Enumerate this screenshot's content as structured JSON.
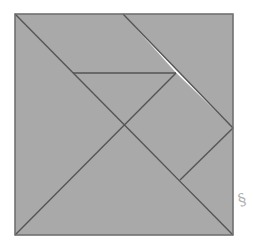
{
  "diagram": {
    "type": "tangram-square",
    "title": "",
    "colors": {
      "fill": "#a9a9a9",
      "stroke": "#555555",
      "border": "#6e6e6e",
      "background": "#ffffff",
      "mark": "#b0b0b0"
    },
    "square": {
      "x": 15,
      "y": 14,
      "width": 218,
      "height": 221
    },
    "pieces": [
      {
        "name": "large-triangle-left",
        "points": "15,14 124,125 15,235"
      },
      {
        "name": "large-triangle-bottom",
        "points": "15,235 124,125 233,235"
      },
      {
        "name": "parallelogram-top",
        "points": "15,14 123,14 176,73 73,73"
      },
      {
        "name": "medium-triangle-top-right",
        "points": "123,14 233,14 233,128"
      },
      {
        "name": "small-triangle-center",
        "points": "73,73 176,73 124,125"
      },
      {
        "name": "square-piece",
        "points": "176,73 233,128 180,180 124,125"
      },
      {
        "name": "small-triangle-right",
        "points": "233,128 233,235 180,180"
      }
    ],
    "lines": [
      {
        "name": "main-diagonal",
        "x1": 15,
        "y1": 14,
        "x2": 233,
        "y2": 235
      },
      {
        "name": "anti-diagonal-segment",
        "x1": 15,
        "y1": 235,
        "x2": 176,
        "y2": 73
      },
      {
        "name": "top-diagonal",
        "x1": 123,
        "y1": 14,
        "x2": 233,
        "y2": 128
      },
      {
        "name": "horizontal-segment",
        "x1": 73,
        "y1": 73,
        "x2": 176,
        "y2": 73
      },
      {
        "name": "lower-right-segment",
        "x1": 233,
        "y1": 128,
        "x2": 180,
        "y2": 180
      }
    ],
    "mark_glyph": "§"
  }
}
